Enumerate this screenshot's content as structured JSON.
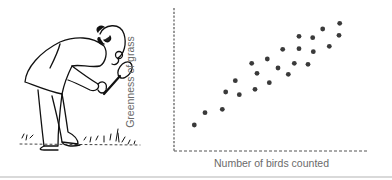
{
  "chart_data": {
    "type": "scatter",
    "title": "",
    "xlabel": "Number of birds counted",
    "ylabel": "Greenness of grass",
    "grid": false,
    "legend": null,
    "ticks": "none",
    "axis_style": "dashed",
    "point_color": "#3a3a3a",
    "points_px": [
      [
        194.3,
        125
      ],
      [
        205,
        112.7
      ],
      [
        222.3,
        109.3
      ],
      [
        225.7,
        92
      ],
      [
        235.3,
        80.7
      ],
      [
        239.3,
        94.7
      ],
      [
        251.7,
        63.3
      ],
      [
        257,
        73.3
      ],
      [
        255,
        89.3
      ],
      [
        267.3,
        59
      ],
      [
        269.3,
        82.7
      ],
      [
        278,
        68
      ],
      [
        282.7,
        49.3
      ],
      [
        288.3,
        74.3
      ],
      [
        294.3,
        63.3
      ],
      [
        299,
        36.3
      ],
      [
        299,
        48.7
      ],
      [
        308,
        64.3
      ],
      [
        312.7,
        37.7
      ],
      [
        313.3,
        51.7
      ],
      [
        322.7,
        29
      ],
      [
        329.3,
        46.3
      ],
      [
        339.7,
        23.3
      ],
      [
        339,
        35.3
      ]
    ],
    "x": [
      10,
      16,
      25,
      27,
      32,
      34,
      40,
      43,
      42,
      48,
      49,
      54,
      56,
      59,
      62,
      64,
      64,
      69,
      71,
      71,
      76,
      79,
      85,
      84
    ],
    "y": [
      18,
      27,
      29,
      41,
      49,
      39,
      61,
      54,
      43,
      64,
      47,
      57,
      70,
      53,
      61,
      80,
      71,
      60,
      79,
      69,
      85,
      73,
      89,
      81
    ],
    "xlim": [
      0,
      100
    ],
    "ylim": [
      0,
      100
    ]
  },
  "illustration": {
    "description": "man-with-magnifying-glass-examining-grass"
  }
}
